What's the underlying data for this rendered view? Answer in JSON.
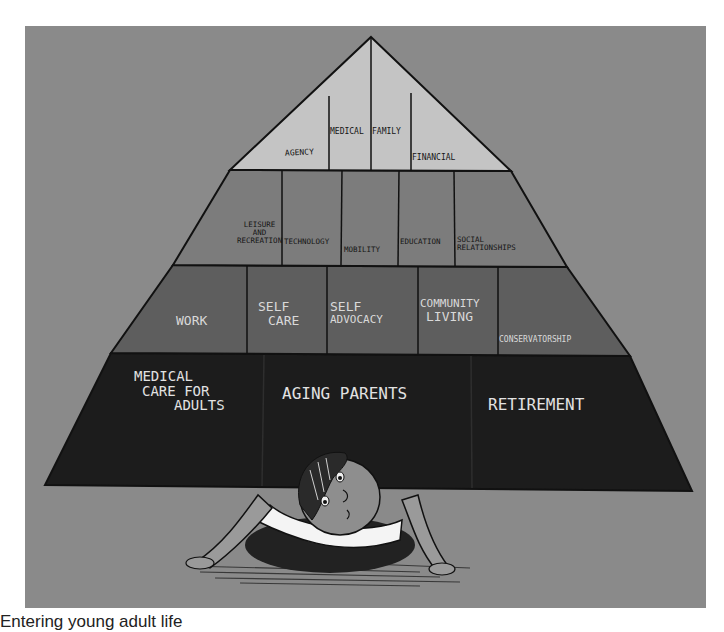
{
  "figure": {
    "colors": {
      "background": "#8a8a8a",
      "tier1": "#c4c4c4",
      "tier2": "#7c7c7c",
      "tier3": "#5e5e5e",
      "tier4": "#1c1c1c",
      "outline": "#111111"
    },
    "tiers": [
      {
        "level": "top",
        "cells": [
          {
            "label": "Agency"
          },
          {
            "label": "Medical"
          },
          {
            "label": "Family"
          },
          {
            "label": "Financial"
          }
        ]
      },
      {
        "level": "second",
        "cells": [
          {
            "label_lines": [
              "Leisure",
              "and",
              "Recreation"
            ]
          },
          {
            "label": "Technology"
          },
          {
            "label": "Mobility"
          },
          {
            "label": "Education"
          },
          {
            "label_lines": [
              "Social",
              "Relationships"
            ]
          }
        ]
      },
      {
        "level": "third",
        "cells": [
          {
            "label": "Work"
          },
          {
            "label_lines": [
              "Self",
              "Care"
            ]
          },
          {
            "label_lines": [
              "Self",
              "Advocacy"
            ]
          },
          {
            "label_lines": [
              "Community",
              "Living"
            ]
          },
          {
            "label": "Conservatorship"
          }
        ]
      },
      {
        "level": "base",
        "cells": [
          {
            "label_lines": [
              "Medical",
              "care for",
              "adults"
            ]
          },
          {
            "label": "Aging Parents"
          },
          {
            "label": "Retirement"
          }
        ]
      }
    ],
    "character": "child-crouching-under-pyramid"
  },
  "caption": {
    "text": "Entering young adult life"
  }
}
